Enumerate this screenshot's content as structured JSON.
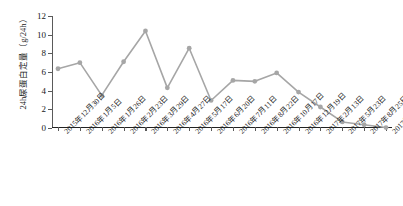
{
  "chart_data": {
    "type": "line",
    "title": "",
    "xlabel": "",
    "ylabel": "24h尿蛋白定量（g/24h）",
    "ylim": [
      0,
      12
    ],
    "yticks": [
      0,
      2,
      4,
      6,
      8,
      10,
      12
    ],
    "grid": false,
    "legend": null,
    "series_color": "#a6a6a6",
    "marker": "circle",
    "categories": [
      "2015年12月30日",
      "2016年1月5日",
      "2016年1月26日",
      "2016年2月23日",
      "2016年3月29日",
      "2016年4月27日",
      "2016年5月17日",
      "2016年6月20日",
      "2016年7月11日",
      "2016年8月22日",
      "2016年10月17日",
      "2016年12月19日",
      "2017年2月13日",
      "2017年5月23日",
      "2017年8月25日",
      "2017年11月20日"
    ],
    "values": [
      6.35,
      7.0,
      3.5,
      7.1,
      10.4,
      4.3,
      8.55,
      2.95,
      5.1,
      5.0,
      5.9,
      3.85,
      2.25,
      0.65,
      0.35,
      0.05
    ]
  },
  "colors": {
    "series": "#a6a6a6",
    "axis": "#222222",
    "tick": "#5a5a5a",
    "text": "#1a1a1a"
  }
}
